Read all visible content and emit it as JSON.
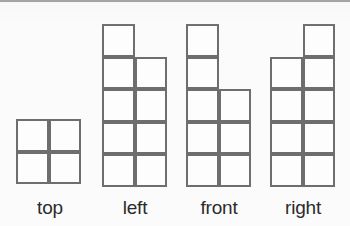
{
  "diagram": {
    "background_color": "#fbfbfb",
    "stroke_color": "#6e6e6e",
    "label_color": "#2b2b2b",
    "cell_size_px": 32.5,
    "top_rule_color": "#474747",
    "views": [
      {
        "id": "top",
        "label": "top",
        "columns": 2,
        "rows": 2,
        "cell_count": 4,
        "origin": {
          "x": 16,
          "y": 119
        },
        "label_center_x": 50,
        "cells": [
          {
            "col": 0,
            "row": 0
          },
          {
            "col": 1,
            "row": 0
          },
          {
            "col": 0,
            "row": 1
          },
          {
            "col": 1,
            "row": 1
          }
        ]
      },
      {
        "id": "left",
        "label": "left",
        "columns": 2,
        "rows": 5,
        "cell_count": 9,
        "origin": {
          "x": 102,
          "y": 24
        },
        "label_center_x": 135,
        "cells": [
          {
            "col": 0,
            "row": 0
          },
          {
            "col": 0,
            "row": 1
          },
          {
            "col": 1,
            "row": 1
          },
          {
            "col": 0,
            "row": 2
          },
          {
            "col": 1,
            "row": 2
          },
          {
            "col": 0,
            "row": 3
          },
          {
            "col": 1,
            "row": 3
          },
          {
            "col": 0,
            "row": 4
          },
          {
            "col": 1,
            "row": 4
          }
        ]
      },
      {
        "id": "front",
        "label": "front",
        "columns": 2,
        "rows": 5,
        "cell_count": 8,
        "origin": {
          "x": 186,
          "y": 24
        },
        "label_center_x": 219,
        "cells": [
          {
            "col": 0,
            "row": 0
          },
          {
            "col": 0,
            "row": 1
          },
          {
            "col": 0,
            "row": 2
          },
          {
            "col": 1,
            "row": 2
          },
          {
            "col": 0,
            "row": 3
          },
          {
            "col": 1,
            "row": 3
          },
          {
            "col": 0,
            "row": 4
          },
          {
            "col": 1,
            "row": 4
          }
        ]
      },
      {
        "id": "right",
        "label": "right",
        "columns": 2,
        "rows": 5,
        "cell_count": 9,
        "origin": {
          "x": 270,
          "y": 24
        },
        "label_center_x": 303,
        "cells": [
          {
            "col": 1,
            "row": 0
          },
          {
            "col": 0,
            "row": 1
          },
          {
            "col": 1,
            "row": 1
          },
          {
            "col": 0,
            "row": 2
          },
          {
            "col": 1,
            "row": 2
          },
          {
            "col": 0,
            "row": 3
          },
          {
            "col": 1,
            "row": 3
          },
          {
            "col": 0,
            "row": 4
          },
          {
            "col": 1,
            "row": 4
          }
        ]
      }
    ]
  }
}
